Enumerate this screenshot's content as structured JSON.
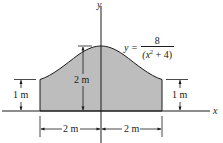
{
  "figure": {
    "axes": {
      "x_label": "x",
      "y_label": "y"
    },
    "equation": {
      "lhs": "y =",
      "numerator": "8",
      "denominator_prefix": "(x",
      "denominator_exp": "2",
      "denominator_suffix": " + 4)"
    },
    "dimensions": {
      "left_height": "1 m",
      "right_height": "1 m",
      "peak_height": "2 m",
      "left_width": "2 m",
      "right_width": "2 m"
    },
    "colors": {
      "fill": "#bdbdbd",
      "stroke": "#1a1a1a",
      "background": "#ffffff"
    }
  }
}
